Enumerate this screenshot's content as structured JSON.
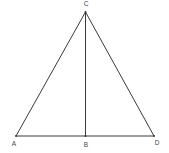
{
  "diagram": {
    "type": "geometry",
    "points": [
      {
        "id": "A",
        "label": "A",
        "x": 16,
        "y": 136,
        "lx": 14,
        "ly": 146
      },
      {
        "id": "B",
        "label": "B",
        "x": 85.5,
        "y": 136,
        "lx": 86,
        "ly": 147
      },
      {
        "id": "C",
        "label": "C",
        "x": 85.5,
        "y": 12,
        "lx": 86,
        "ly": 6
      },
      {
        "id": "D",
        "label": "D",
        "x": 154,
        "y": 136,
        "lx": 157,
        "ly": 145
      }
    ],
    "segments": [
      {
        "from": "A",
        "to": "C"
      },
      {
        "from": "C",
        "to": "D"
      },
      {
        "from": "A",
        "to": "D"
      },
      {
        "from": "C",
        "to": "B"
      }
    ],
    "colors": {
      "line": "#3a3a3a",
      "label": "#444444",
      "background": "#ffffff"
    }
  }
}
